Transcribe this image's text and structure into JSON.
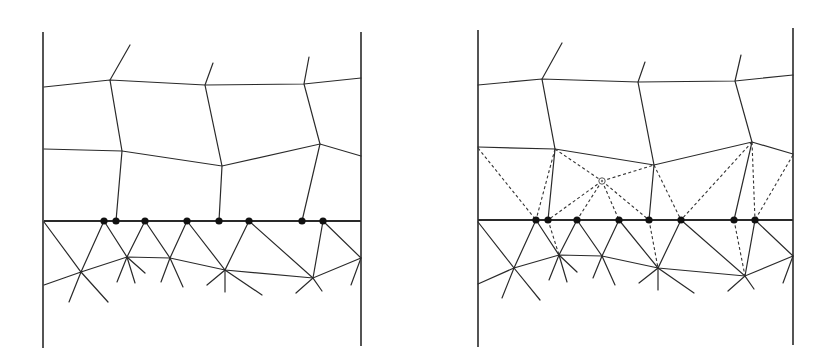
{
  "figure": {
    "colors": {
      "line": "#2a2a2a",
      "node": "#111111",
      "background": "#ffffff"
    },
    "panels": [
      {
        "id": "left",
        "walls": [
          [
            43,
            32,
            43,
            348
          ],
          [
            361,
            32,
            361,
            346
          ]
        ],
        "interface": [
          [
            44,
            221
          ],
          [
            361,
            221
          ]
        ],
        "top_lines": [
          [
            [
              44,
              87
            ],
            [
              110,
              80
            ],
            [
              205,
              85
            ],
            [
              304,
              84
            ],
            [
              361,
              78
            ]
          ],
          [
            [
              44,
              149
            ],
            [
              122,
              151
            ],
            [
              222,
              166
            ],
            [
              320,
              144
            ],
            [
              361,
              156
            ]
          ]
        ],
        "verticals": [
          [
            [
              130,
              45
            ],
            [
              110,
              80
            ],
            [
              122,
              151
            ],
            [
              116,
              221
            ]
          ],
          [
            [
              213,
              63
            ],
            [
              205,
              85
            ],
            [
              222,
              166
            ],
            [
              219,
              221
            ]
          ],
          [
            [
              309,
              57
            ],
            [
              304,
              84
            ],
            [
              320,
              144
            ],
            [
              302,
              221
            ]
          ]
        ],
        "lower_line": [
          [
            44,
            285
          ],
          [
            81,
            272
          ],
          [
            127,
            257
          ],
          [
            170,
            258
          ],
          [
            225,
            270
          ],
          [
            313,
            278
          ],
          [
            361,
            258
          ]
        ],
        "interface_nodes": [
          [
            104,
            221
          ],
          [
            116,
            221
          ],
          [
            145,
            221
          ],
          [
            187,
            221
          ],
          [
            219,
            221
          ],
          [
            249,
            221
          ],
          [
            302,
            221
          ],
          [
            323,
            221
          ]
        ],
        "star_centers": [
          [
            81,
            272
          ],
          [
            127,
            257
          ],
          [
            170,
            258
          ],
          [
            225,
            270
          ],
          [
            313,
            278
          ],
          [
            361,
            258
          ]
        ],
        "star_spokes": [
          [
            [
              44,
              222
            ],
            [
              81,
              272
            ],
            [
              108,
              302
            ]
          ],
          [
            [
              104,
              221
            ],
            [
              81,
              272
            ],
            [
              69,
              302
            ]
          ],
          [
            [
              104,
              221
            ],
            [
              127,
              257
            ],
            [
              145,
              273
            ]
          ],
          [
            [
              145,
              221
            ],
            [
              127,
              257
            ],
            [
              117,
              282
            ]
          ],
          [
            [
              127,
              257
            ],
            [
              135,
              283
            ]
          ],
          [
            [
              187,
              221
            ],
            [
              170,
              258
            ],
            [
              183,
              287
            ]
          ],
          [
            [
              145,
              221
            ],
            [
              170,
              258
            ]
          ],
          [
            [
              170,
              258
            ],
            [
              161,
              282
            ]
          ],
          [
            [
              187,
              221
            ],
            [
              225,
              270
            ],
            [
              262,
              295
            ]
          ],
          [
            [
              249,
              221
            ],
            [
              225,
              270
            ],
            [
              207,
              285
            ]
          ],
          [
            [
              225,
              270
            ],
            [
              225,
              292
            ]
          ],
          [
            [
              249,
              221
            ],
            [
              313,
              278
            ],
            [
              296,
              293
            ]
          ],
          [
            [
              323,
              221
            ],
            [
              313,
              278
            ],
            [
              322,
              291
            ]
          ],
          [
            [
              323,
              221
            ],
            [
              361,
              258
            ],
            [
              351,
              285
            ]
          ]
        ]
      },
      {
        "id": "right",
        "walls": [
          [
            478,
            30,
            478,
            347
          ],
          [
            793,
            28,
            793,
            345
          ]
        ],
        "interface": [
          [
            478,
            220
          ],
          [
            793,
            220
          ]
        ],
        "top_lines": [
          [
            [
              478,
              85
            ],
            [
              542,
              79
            ],
            [
              638,
              82
            ],
            [
              735,
              81
            ],
            [
              793,
              75
            ]
          ],
          [
            [
              478,
              147
            ],
            [
              555,
              149
            ],
            [
              654,
              165
            ],
            [
              752,
              142
            ],
            [
              793,
              154
            ]
          ]
        ],
        "verticals": [
          [
            [
              562,
              43
            ],
            [
              542,
              79
            ],
            [
              555,
              149
            ],
            [
              548,
              220
            ]
          ],
          [
            [
              645,
              62
            ],
            [
              638,
              82
            ],
            [
              654,
              165
            ],
            [
              649,
              220
            ]
          ],
          [
            [
              741,
              55
            ],
            [
              735,
              81
            ],
            [
              752,
              142
            ],
            [
              734,
              220
            ]
          ]
        ],
        "lower_line": [
          [
            478,
            284
          ],
          [
            514,
            268
          ],
          [
            559,
            255
          ],
          [
            602,
            256
          ],
          [
            658,
            268
          ],
          [
            745,
            276
          ],
          [
            793,
            256
          ]
        ],
        "interface_nodes": [
          [
            536,
            220
          ],
          [
            548,
            220
          ],
          [
            577,
            220
          ],
          [
            619,
            220
          ],
          [
            649,
            220
          ],
          [
            681,
            220
          ],
          [
            734,
            220
          ],
          [
            755,
            220
          ]
        ],
        "inserted_node": [
          602,
          181
        ],
        "dashed_lines": [
          [
            [
              478,
              148
            ],
            [
              536,
              220
            ]
          ],
          [
            [
              555,
              149
            ],
            [
              536,
              220
            ]
          ],
          [
            [
              555,
              149
            ],
            [
              602,
              181
            ]
          ],
          [
            [
              602,
              181
            ],
            [
              548,
              220
            ]
          ],
          [
            [
              602,
              181
            ],
            [
              577,
              220
            ]
          ],
          [
            [
              602,
              181
            ],
            [
              619,
              220
            ]
          ],
          [
            [
              602,
              181
            ],
            [
              649,
              220
            ]
          ],
          [
            [
              602,
              181
            ],
            [
              654,
              165
            ]
          ],
          [
            [
              654,
              165
            ],
            [
              681,
              220
            ]
          ],
          [
            [
              752,
              142
            ],
            [
              681,
              220
            ]
          ],
          [
            [
              752,
              142
            ],
            [
              755,
              220
            ]
          ],
          [
            [
              793,
              155
            ],
            [
              755,
              220
            ]
          ],
          [
            [
              548,
              220
            ],
            [
              559,
              255
            ]
          ],
          [
            [
              649,
              220
            ],
            [
              658,
              268
            ]
          ],
          [
            [
              734,
              220
            ],
            [
              745,
              276
            ]
          ]
        ],
        "star_spokes": [
          [
            [
              478,
              222
            ],
            [
              514,
              268
            ],
            [
              540,
              300
            ]
          ],
          [
            [
              536,
              220
            ],
            [
              514,
              268
            ],
            [
              502,
              298
            ]
          ],
          [
            [
              536,
              220
            ],
            [
              559,
              255
            ],
            [
              577,
              272
            ]
          ],
          [
            [
              577,
              220
            ],
            [
              559,
              255
            ],
            [
              549,
              280
            ]
          ],
          [
            [
              559,
              255
            ],
            [
              567,
              282
            ]
          ],
          [
            [
              619,
              220
            ],
            [
              602,
              256
            ],
            [
              615,
              285
            ]
          ],
          [
            [
              577,
              220
            ],
            [
              602,
              256
            ]
          ],
          [
            [
              602,
              256
            ],
            [
              593,
              278
            ]
          ],
          [
            [
              619,
              220
            ],
            [
              658,
              268
            ],
            [
              694,
              293
            ]
          ],
          [
            [
              681,
              220
            ],
            [
              658,
              268
            ],
            [
              639,
              283
            ]
          ],
          [
            [
              658,
              268
            ],
            [
              658,
              290
            ]
          ],
          [
            [
              681,
              220
            ],
            [
              745,
              276
            ],
            [
              728,
              291
            ]
          ],
          [
            [
              755,
              220
            ],
            [
              745,
              276
            ],
            [
              754,
              289
            ]
          ],
          [
            [
              755,
              220
            ],
            [
              793,
              256
            ],
            [
              783,
              283
            ]
          ]
        ]
      }
    ]
  }
}
